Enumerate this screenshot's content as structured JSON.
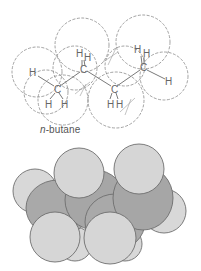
{
  "figure": {
    "title": "n-butane",
    "caption": {
      "prefix": "n",
      "suffix": "-butane"
    },
    "structural_model": {
      "style": "dashed-outline ball-and-stick",
      "atoms": [
        {
          "label": "H",
          "x": 33,
          "y": 73
        },
        {
          "label": "C",
          "x": 57,
          "y": 90
        },
        {
          "label": "H",
          "x": 48,
          "y": 106
        },
        {
          "label": "H",
          "x": 64,
          "y": 106
        },
        {
          "label": "H",
          "x": 78,
          "y": 52
        },
        {
          "label": "H",
          "x": 86,
          "y": 55
        },
        {
          "label": "C",
          "x": 83,
          "y": 70
        },
        {
          "label": "C",
          "x": 114,
          "y": 90
        },
        {
          "label": "H",
          "x": 109,
          "y": 106
        },
        {
          "label": "H",
          "x": 118,
          "y": 106
        },
        {
          "label": "H",
          "x": 137,
          "y": 47
        },
        {
          "label": "H",
          "x": 145,
          "y": 52
        },
        {
          "label": "C",
          "x": 143,
          "y": 68
        },
        {
          "label": "H",
          "x": 168,
          "y": 82
        }
      ]
    },
    "space_filling_model": {
      "style": "grayscale space-filling",
      "colors": {
        "hydrogen": "#d6d6d6",
        "carbon": "#a9a9a9",
        "outline": "#6e6e6e"
      }
    }
  }
}
